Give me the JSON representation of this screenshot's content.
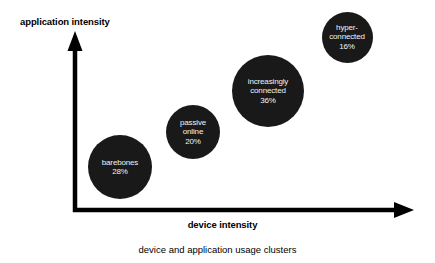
{
  "chart_data": {
    "type": "scatter",
    "title": "",
    "caption": "device and application usage clusters",
    "xlabel": "device intensity",
    "ylabel": "application intensity",
    "grid": false,
    "legend": "none",
    "axis_style": "arrow",
    "xlim": [
      0,
      100
    ],
    "ylim": [
      0,
      100
    ],
    "bubble_color": "#191919",
    "label_color": "#f2f2f2",
    "axis_color": "#000000",
    "background_color": "#ffffff",
    "size_metric": "share of respondents (%)",
    "points": [
      {
        "name": "barebones",
        "label_lines": [
          "barebones"
        ],
        "value_label": "28%",
        "value": 28,
        "x": 14,
        "y": 27,
        "cx": 120,
        "cy": 167,
        "diameter": 64
      },
      {
        "name": "passive online",
        "label_lines": [
          "passive",
          "online"
        ],
        "value_label": "20%",
        "value": 20,
        "x": 35,
        "y": 43,
        "cx": 193,
        "cy": 132,
        "diameter": 54
      },
      {
        "name": "increasingly connected",
        "label_lines": [
          "increasingly",
          "connected"
        ],
        "value_label": "36%",
        "value": 36,
        "x": 57,
        "y": 66,
        "cx": 268,
        "cy": 91,
        "diameter": 72
      },
      {
        "name": "hyper-connected",
        "label_lines": [
          "hyper-",
          "connected"
        ],
        "value_label": "16%",
        "value": 16,
        "x": 80,
        "y": 96,
        "cx": 347,
        "cy": 37,
        "diameter": 51
      }
    ]
  },
  "figure": {
    "y_axis_title": "application intensity",
    "x_axis_title": "device intensity",
    "caption": "device and application usage clusters"
  }
}
